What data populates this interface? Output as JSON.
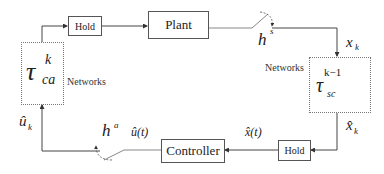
{
  "diagram": {
    "type": "networked-control-loop",
    "blocks": {
      "hold_top": "Hold",
      "plant": "Plant",
      "hold_bottom": "Hold",
      "controller": "Controller"
    },
    "networks": {
      "left_label": "Networks",
      "right_label": "Networks",
      "left_delay": {
        "symbol": "τ",
        "sup": "k",
        "sub": "ca"
      },
      "right_delay": {
        "symbol": "τ",
        "sup": "k−1",
        "sub": "sc"
      }
    },
    "signals": {
      "sensor_sampler": {
        "base": "h",
        "sup": "s"
      },
      "actuator_sampler": {
        "base": "h",
        "sup": "a"
      },
      "x_k": {
        "base": "x",
        "sub": "k"
      },
      "x_hat_k": {
        "base": "x̂",
        "sub": "k"
      },
      "x_hat_t": "x̂(t)",
      "u_hat_t": "û(t)",
      "u_hat_k": {
        "base": "û",
        "sub": "k"
      }
    }
  }
}
